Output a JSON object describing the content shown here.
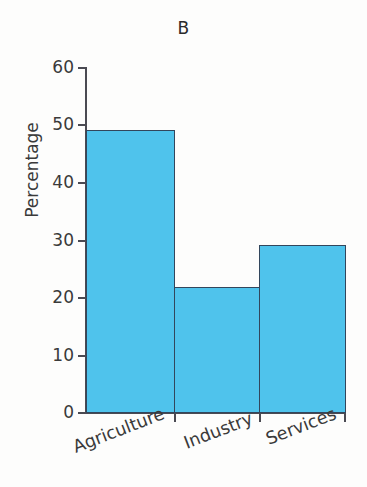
{
  "chart_data": {
    "type": "bar",
    "title": "B",
    "xlabel": "",
    "ylabel": "Percentage",
    "categories": [
      "Agriculture",
      "Industry",
      "Services"
    ],
    "values": [
      49.3,
      22.0,
      29.3
    ],
    "ylim": [
      0,
      60
    ],
    "yticks": [
      0,
      10,
      20,
      30,
      40,
      50,
      60
    ],
    "ytick_labels": [
      "0",
      "10",
      "20",
      "30",
      "40",
      "50",
      "60"
    ],
    "grid": false,
    "legend": null,
    "bar_fill_color": "#4FC3EC",
    "bar_edge_color": "#32465C",
    "axis_color": "#4A4A52",
    "background_color": "#FDFDFC",
    "xtick_label_rotation": -21
  }
}
